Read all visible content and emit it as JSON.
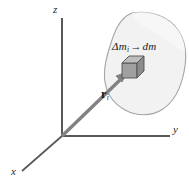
{
  "figure": {
    "background_color": "#ffffff"
  },
  "axes": {
    "color": "#595959",
    "origin": {
      "x": 62,
      "y": 136
    },
    "z_axis": {
      "label": "z",
      "from": {
        "x": 62,
        "y": 136
      },
      "to": {
        "x": 62,
        "y": 18
      }
    },
    "y_axis": {
      "label": "y",
      "from": {
        "x": 62,
        "y": 136
      },
      "to": {
        "x": 170,
        "y": 136
      }
    },
    "x_axis": {
      "label": "x",
      "from": {
        "x": 62,
        "y": 136
      },
      "to": {
        "x": 22,
        "y": 171
      }
    }
  },
  "body": {
    "name": "rigid-body-blob",
    "fill_color": "#f2f2f2",
    "stroke_color": "#9a9a9a",
    "bounds": {
      "left": 105,
      "top": 12,
      "right": 186,
      "bottom": 115
    }
  },
  "mass_element": {
    "name": "mass-element-cube",
    "label_delta": "Δm",
    "label_delta_subscript": "i",
    "label_arrow": "→",
    "label_dm": "dm",
    "top_face_color": "#b5b5b5",
    "front_face_color": "#9e9e9e",
    "side_face_color": "#8a8a8a",
    "stroke_color": "#4a4a4a",
    "position": {
      "x": 128,
      "y": 62
    }
  },
  "position_vector": {
    "name": "position-vector-r-i",
    "label_symbol": "r",
    "label_subscript": "i",
    "color": "#7a7a7a",
    "from": {
      "x": 62,
      "y": 136
    },
    "to": {
      "x": 126,
      "y": 74
    }
  }
}
